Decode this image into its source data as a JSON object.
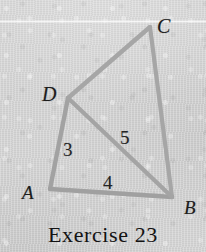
{
  "figure": {
    "caption": "Exercise 23",
    "stroke_color": "#a2a2a2",
    "background_color": "#d3d3d3",
    "label_color": "#1d1d1d",
    "vertices": [
      {
        "name": "A",
        "label": "A",
        "x": 50,
        "y": 189,
        "label_x": 22,
        "label_y": 183
      },
      {
        "name": "B",
        "label": "B",
        "x": 172,
        "y": 197,
        "label_x": 184,
        "label_y": 198
      },
      {
        "name": "C",
        "label": "C",
        "x": 150,
        "y": 27,
        "label_x": 157,
        "label_y": 16
      },
      {
        "name": "D",
        "label": "D",
        "x": 68,
        "y": 98,
        "label_x": 42,
        "label_y": 84
      }
    ],
    "edges": [
      {
        "name": "edge-A-D",
        "from": "A",
        "to": "D",
        "length_label": "3",
        "label_x": 63,
        "label_y": 140
      },
      {
        "name": "edge-A-B",
        "from": "A",
        "to": "B",
        "length_label": "4",
        "label_x": 103,
        "label_y": 173
      },
      {
        "name": "edge-D-B",
        "from": "D",
        "to": "B",
        "length_label": "5",
        "label_x": 120,
        "label_y": 128
      },
      {
        "name": "edge-D-C",
        "from": "D",
        "to": "C",
        "length_label": "",
        "label_x": 0,
        "label_y": 0
      },
      {
        "name": "edge-C-B",
        "from": "C",
        "to": "B",
        "length_label": "",
        "label_x": 0,
        "label_y": 0
      }
    ]
  }
}
